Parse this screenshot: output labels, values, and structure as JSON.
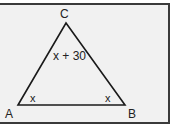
{
  "diagram": {
    "type": "triangle",
    "vertices": [
      {
        "name": "A",
        "label": "A"
      },
      {
        "name": "B",
        "label": "B"
      },
      {
        "name": "C",
        "label": "C"
      }
    ],
    "angles": {
      "A": "x",
      "B": "x",
      "C": "x + 30"
    },
    "colors": {
      "background": "#f1f1f1",
      "stroke": "#1a1a1a",
      "frame": "#3a3a3a"
    }
  }
}
